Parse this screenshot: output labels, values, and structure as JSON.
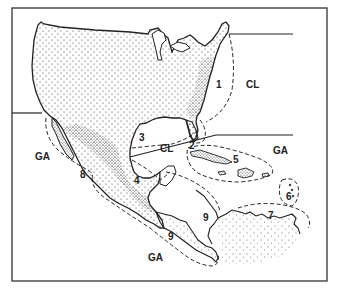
{
  "map": {
    "title": "",
    "region_labels": [
      {
        "id": "1",
        "text": "1",
        "x": 271,
        "y": 83
      },
      {
        "id": "CL-east",
        "text": "CL",
        "x": 298,
        "y": 82
      },
      {
        "id": "2",
        "text": "2",
        "x": 191,
        "y": 142
      },
      {
        "id": "3",
        "text": "3",
        "x": 139,
        "y": 133
      },
      {
        "id": "CL-gulf",
        "text": "CL",
        "x": 160,
        "y": 143
      },
      {
        "id": "4",
        "text": "4",
        "x": 134,
        "y": 177
      },
      {
        "id": "5",
        "text": "5",
        "x": 233,
        "y": 154
      },
      {
        "id": "GA-east",
        "text": "GA",
        "x": 274,
        "y": 152
      },
      {
        "id": "6",
        "text": "6",
        "x": 288,
        "y": 197
      },
      {
        "id": "7",
        "text": "7",
        "x": 271,
        "y": 211
      },
      {
        "id": "8",
        "text": "8",
        "x": 80,
        "y": 172
      },
      {
        "id": "GA-west",
        "text": "GA",
        "x": 34,
        "y": 155
      },
      {
        "id": "9-north",
        "text": "9",
        "x": 205,
        "y": 211
      },
      {
        "id": "9-south",
        "text": "9",
        "x": 168,
        "y": 235
      },
      {
        "id": "GA-south",
        "text": "GA",
        "x": 148,
        "y": 254
      }
    ],
    "legend": {
      "CL": "CL",
      "GA": "GA"
    },
    "colors": {
      "ink": "#222222",
      "background": "#ffffff",
      "frame": "#333333"
    }
  }
}
